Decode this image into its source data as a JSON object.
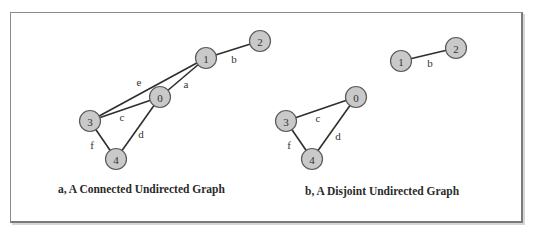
{
  "figure": {
    "graphs": [
      {
        "id": "a",
        "caption": "a, A Connected Undirected Graph",
        "nodes": [
          {
            "id": "0",
            "label": "0"
          },
          {
            "id": "1",
            "label": "1"
          },
          {
            "id": "2",
            "label": "2"
          },
          {
            "id": "3",
            "label": "3"
          },
          {
            "id": "4",
            "label": "4"
          }
        ],
        "edges": [
          {
            "label": "a",
            "from": "0",
            "to": "1"
          },
          {
            "label": "b",
            "from": "1",
            "to": "2"
          },
          {
            "label": "c",
            "from": "3",
            "to": "0"
          },
          {
            "label": "d",
            "from": "0",
            "to": "4"
          },
          {
            "label": "e",
            "from": "3",
            "to": "1"
          },
          {
            "label": "f",
            "from": "3",
            "to": "4"
          }
        ]
      },
      {
        "id": "b",
        "caption": "b, A Disjoint Undirected Graph",
        "nodes": [
          {
            "id": "0",
            "label": "0"
          },
          {
            "id": "1",
            "label": "1"
          },
          {
            "id": "2",
            "label": "2"
          },
          {
            "id": "3",
            "label": "3"
          },
          {
            "id": "4",
            "label": "4"
          }
        ],
        "edges": [
          {
            "label": "b",
            "from": "1",
            "to": "2"
          },
          {
            "label": "c",
            "from": "3",
            "to": "0"
          },
          {
            "label": "d",
            "from": "0",
            "to": "4"
          },
          {
            "label": "f",
            "from": "3",
            "to": "4"
          }
        ]
      }
    ]
  }
}
